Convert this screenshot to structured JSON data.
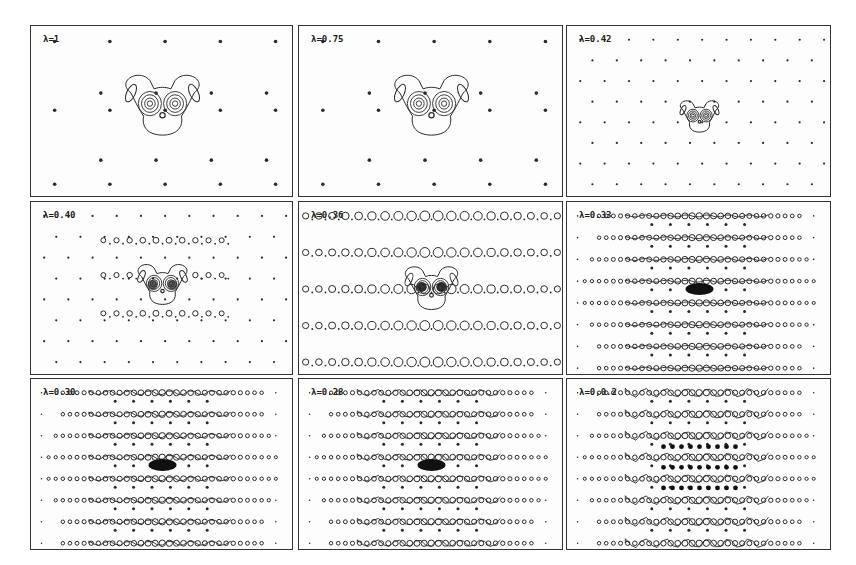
{
  "figure": {
    "panels": [
      {
        "id": "p1",
        "label": "λ=1",
        "x": 30,
        "y": 25,
        "w": 263,
        "h": 172,
        "regime": "isolated",
        "lattice": "sparse",
        "rows": 0,
        "density": 0
      },
      {
        "id": "p2",
        "label": "λ=0.75",
        "x": 298,
        "y": 25,
        "w": 265,
        "h": 172,
        "regime": "isolated",
        "lattice": "sparse",
        "rows": 0,
        "density": 0
      },
      {
        "id": "p3",
        "label": "λ=0.42",
        "x": 566,
        "y": 25,
        "w": 265,
        "h": 172,
        "regime": "isolated-small",
        "lattice": "dense",
        "rows": 0,
        "density": 0
      },
      {
        "id": "p4",
        "label": "λ=0.40",
        "x": 30,
        "y": 201,
        "w": 263,
        "h": 174,
        "regime": "rings",
        "lattice": "dense",
        "rows": 3,
        "density": 1
      },
      {
        "id": "p5",
        "label": "λ=0.36",
        "x": 298,
        "y": 201,
        "w": 265,
        "h": 174,
        "regime": "rings",
        "lattice": "none",
        "rows": 5,
        "density": 2
      },
      {
        "id": "p6",
        "label": "λ=0.33",
        "x": 566,
        "y": 201,
        "w": 265,
        "h": 174,
        "regime": "chains",
        "lattice": "none",
        "rows": 8,
        "density": 3
      },
      {
        "id": "p7",
        "label": "λ=0.30",
        "x": 30,
        "y": 378,
        "w": 263,
        "h": 172,
        "regime": "chains",
        "lattice": "none",
        "rows": 8,
        "density": 4
      },
      {
        "id": "p8",
        "label": "λ=0.28",
        "x": 298,
        "y": 378,
        "w": 265,
        "h": 172,
        "regime": "chains",
        "lattice": "none",
        "rows": 8,
        "density": 5
      },
      {
        "id": "p9",
        "label": "λ=0,0.2",
        "x": 566,
        "y": 378,
        "w": 265,
        "h": 172,
        "regime": "chains",
        "lattice": "none",
        "rows": 8,
        "density": 6
      }
    ]
  },
  "colors": {
    "ink": "#2a2a2a",
    "frame": "#333333",
    "paper": "#ffffff"
  }
}
